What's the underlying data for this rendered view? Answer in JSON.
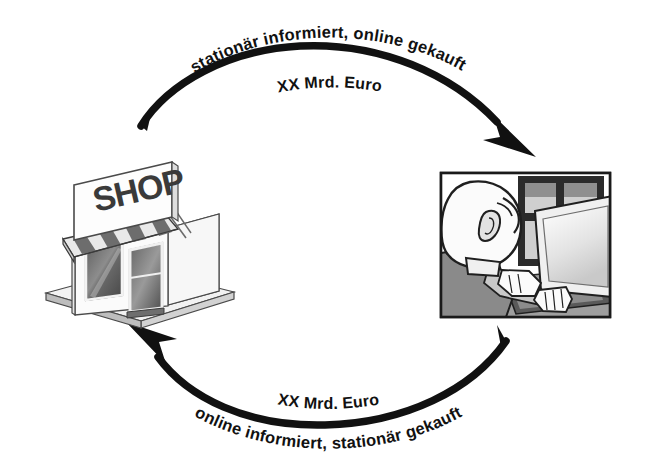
{
  "diagram": {
    "type": "cycle-diagram",
    "background_color": "#ffffff",
    "stroke_color": "#111111",
    "flows": [
      {
        "id": "top-flow",
        "direction": "shop-to-online",
        "caption": "stationär informiert, online gekauft",
        "value": "XX Mrd. Euro",
        "arrow_target": "online-shopper"
      },
      {
        "id": "bottom-flow",
        "direction": "online-to-shop",
        "caption": "online informiert, stationär gekauft",
        "value": "XX Mrd. Euro",
        "arrow_target": "retail-shop"
      }
    ],
    "nodes": [
      {
        "id": "retail-shop",
        "name": "retail-shop-illustration",
        "sign_text": "SHOP"
      },
      {
        "id": "online-shopper",
        "name": "online-shopper-illustration",
        "sign_text": ""
      }
    ]
  }
}
